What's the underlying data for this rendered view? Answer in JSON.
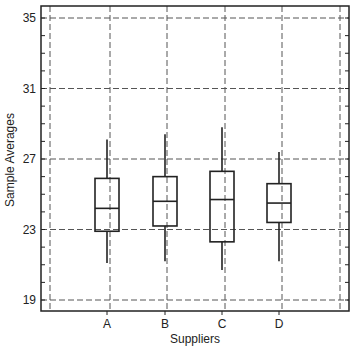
{
  "chart_data": {
    "type": "boxplot",
    "title": "",
    "xlabel": "Suppliers",
    "ylabel": "Sample Averages",
    "categories": [
      "A",
      "B",
      "C",
      "D"
    ],
    "yticks": [
      19,
      23,
      27,
      31,
      35
    ],
    "ylim": [
      18.3,
      35.7
    ],
    "grid": true,
    "grid_style": "dashed",
    "legend": null,
    "boxes": [
      {
        "name": "A",
        "whisker_low": 21.1,
        "q1": 22.9,
        "median": 24.2,
        "q3": 25.9,
        "whisker_high": 28.1
      },
      {
        "name": "B",
        "whisker_low": 21.2,
        "q1": 23.2,
        "median": 24.6,
        "q3": 26.0,
        "whisker_high": 28.4
      },
      {
        "name": "C",
        "whisker_low": 20.7,
        "q1": 22.3,
        "median": 24.7,
        "q3": 26.3,
        "whisker_high": 28.8
      },
      {
        "name": "D",
        "whisker_low": 21.2,
        "q1": 23.4,
        "median": 24.5,
        "q3": 25.6,
        "whisker_high": 27.4
      }
    ]
  },
  "labels": {
    "xlabel": "Suppliers",
    "ylabel": "Sample Averages",
    "yticks": [
      "19",
      "23",
      "27",
      "31",
      "35"
    ],
    "xticks": [
      "A",
      "B",
      "C",
      "D"
    ]
  }
}
